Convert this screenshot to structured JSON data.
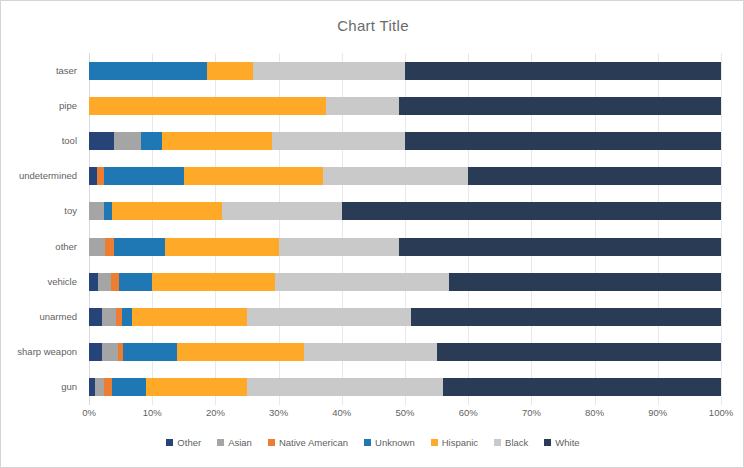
{
  "chart": {
    "title": "Chart Title",
    "border_color": "#d4d4d4",
    "background": "#ffffff",
    "text_color": "#5f5f5f"
  },
  "legend": {
    "position": "bottom",
    "entries": [
      {
        "label": "Other",
        "color": "#264478"
      },
      {
        "label": "Asian",
        "color": "#a5a5a5"
      },
      {
        "label": "Native American",
        "color": "#ed7d31"
      },
      {
        "label": "Unknown",
        "color": "#1f77b4"
      },
      {
        "label": "Hispanic",
        "color": "#ffa929"
      },
      {
        "label": "Black",
        "color": "#c9c9c9"
      },
      {
        "label": "White",
        "color": "#2a3b55"
      }
    ]
  },
  "x_axis": {
    "ticks": [
      "0%",
      "10%",
      "20%",
      "30%",
      "40%",
      "50%",
      "60%",
      "70%",
      "80%",
      "90%",
      "100%"
    ]
  },
  "chart_data": {
    "type": "bar",
    "orientation": "horizontal",
    "stacked": true,
    "stack_mode": "percent",
    "title": "Chart Title",
    "xlabel": "",
    "ylabel": "",
    "xlim": [
      0,
      100
    ],
    "grid": true,
    "legend_position": "bottom",
    "categories": [
      "taser",
      "pipe",
      "tool",
      "undetermined",
      "toy",
      "other",
      "vehicle",
      "unarmed",
      "sharp weapon",
      "gun"
    ],
    "series": [
      {
        "name": "Other",
        "color": "#264478",
        "values": [
          0.0,
          0.0,
          4.0,
          1.3,
          0.0,
          0.0,
          1.5,
          2.0,
          2.0,
          1.0
        ]
      },
      {
        "name": "Asian",
        "color": "#a5a5a5",
        "values": [
          0.0,
          0.0,
          4.2,
          0.0,
          2.4,
          2.5,
          2.0,
          2.3,
          2.6,
          1.4
        ]
      },
      {
        "name": "Native American",
        "color": "#ed7d31",
        "values": [
          0.0,
          0.0,
          0.0,
          1.0,
          0.0,
          1.5,
          1.3,
          0.9,
          0.8,
          1.2
        ]
      },
      {
        "name": "Unknown",
        "color": "#1f77b4",
        "values": [
          18.7,
          0.0,
          3.3,
          12.7,
          1.2,
          8.0,
          5.2,
          1.6,
          8.6,
          5.4
        ]
      },
      {
        "name": "Hispanic",
        "color": "#ffa929",
        "values": [
          7.3,
          37.5,
          17.5,
          22.0,
          17.4,
          18.0,
          19.5,
          18.2,
          20.0,
          16.0
        ]
      },
      {
        "name": "Black",
        "color": "#c9c9c9",
        "values": [
          24.0,
          11.5,
          21.0,
          23.0,
          19.0,
          19.0,
          27.5,
          26.0,
          21.0,
          31.0
        ]
      },
      {
        "name": "White",
        "color": "#2a3b55",
        "values": [
          50.0,
          51.0,
          50.0,
          40.0,
          60.0,
          51.0,
          43.0,
          49.0,
          45.0,
          44.0
        ]
      }
    ]
  }
}
